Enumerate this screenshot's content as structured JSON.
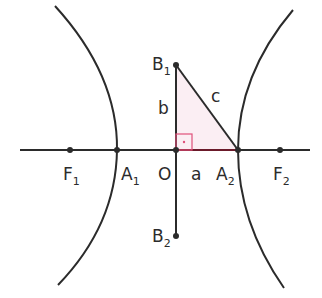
{
  "diagram": {
    "type": "hyperbola",
    "colors": {
      "stroke": "#2b2b2b",
      "triangle_fill": "#fbeef3",
      "right_angle": "#e0507a",
      "segment_a": "#6b1a2a"
    },
    "labels": {
      "F1": {
        "main": "F",
        "sub": "1"
      },
      "A1": {
        "main": "A",
        "sub": "1"
      },
      "O": {
        "main": "O"
      },
      "a": {
        "main": "a"
      },
      "A2": {
        "main": "A",
        "sub": "2"
      },
      "F2": {
        "main": "F",
        "sub": "2"
      },
      "B1": {
        "main": "B",
        "sub": "1"
      },
      "B2": {
        "main": "B",
        "sub": "2"
      },
      "b": {
        "main": "b"
      },
      "c": {
        "main": "c"
      }
    }
  }
}
